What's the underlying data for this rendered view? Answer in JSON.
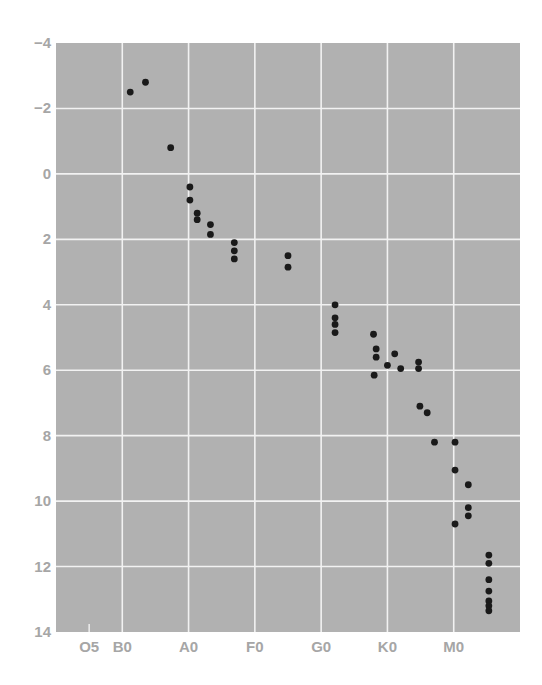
{
  "chart_data": {
    "type": "scatter",
    "title": "",
    "xlabel": "",
    "ylabel": "",
    "x_axis": {
      "kind": "spectral_class",
      "range": [
        0,
        70
      ],
      "tick_values": [
        5,
        10,
        20,
        30,
        40,
        50,
        60
      ],
      "tick_labels": [
        "O5",
        "B0",
        "A0",
        "F0",
        "G0",
        "K0",
        "M0"
      ],
      "gridlines": [
        10,
        20,
        30,
        40,
        50,
        60
      ]
    },
    "y_axis": {
      "range": [
        -4,
        14
      ],
      "inverted": true,
      "tick_values": [
        -4,
        -2,
        0,
        2,
        4,
        6,
        8,
        10,
        12,
        14
      ],
      "tick_labels": [
        "−4",
        "−2",
        "0",
        "2",
        "4",
        "6",
        "8",
        "10",
        "12",
        "14"
      ],
      "gridlines": [
        -2,
        0,
        2,
        4,
        6,
        8,
        10,
        12
      ]
    },
    "grid": true,
    "legend": null,
    "colors": {
      "background": "#b1b1b1",
      "grid": "#f2f2f2",
      "point": "#1a1a1a",
      "tick_text": "#a6a6a6"
    },
    "points": [
      {
        "x": 11.2,
        "y": -2.5
      },
      {
        "x": 13.5,
        "y": -2.8
      },
      {
        "x": 17.3,
        "y": -0.8
      },
      {
        "x": 20.2,
        "y": 0.4
      },
      {
        "x": 20.2,
        "y": 0.8
      },
      {
        "x": 21.3,
        "y": 1.2
      },
      {
        "x": 21.3,
        "y": 1.4
      },
      {
        "x": 23.3,
        "y": 1.55
      },
      {
        "x": 23.3,
        "y": 1.85
      },
      {
        "x": 26.9,
        "y": 2.1
      },
      {
        "x": 26.9,
        "y": 2.35
      },
      {
        "x": 26.9,
        "y": 2.6
      },
      {
        "x": 35.0,
        "y": 2.5
      },
      {
        "x": 35.0,
        "y": 2.85
      },
      {
        "x": 42.1,
        "y": 4.0
      },
      {
        "x": 42.1,
        "y": 4.4
      },
      {
        "x": 42.1,
        "y": 4.6
      },
      {
        "x": 42.1,
        "y": 4.85
      },
      {
        "x": 47.9,
        "y": 4.9
      },
      {
        "x": 48.3,
        "y": 5.35
      },
      {
        "x": 48.3,
        "y": 5.6
      },
      {
        "x": 48.0,
        "y": 6.15
      },
      {
        "x": 50.0,
        "y": 5.85
      },
      {
        "x": 51.1,
        "y": 5.5
      },
      {
        "x": 52.0,
        "y": 5.95
      },
      {
        "x": 54.7,
        "y": 5.75
      },
      {
        "x": 54.7,
        "y": 5.95
      },
      {
        "x": 54.9,
        "y": 7.1
      },
      {
        "x": 56.0,
        "y": 7.3
      },
      {
        "x": 57.1,
        "y": 8.2
      },
      {
        "x": 60.2,
        "y": 8.2
      },
      {
        "x": 60.2,
        "y": 9.05
      },
      {
        "x": 62.2,
        "y": 9.5
      },
      {
        "x": 62.2,
        "y": 10.2
      },
      {
        "x": 62.2,
        "y": 10.45
      },
      {
        "x": 60.2,
        "y": 10.7
      },
      {
        "x": 65.3,
        "y": 11.65
      },
      {
        "x": 65.3,
        "y": 11.9
      },
      {
        "x": 65.3,
        "y": 12.4
      },
      {
        "x": 65.3,
        "y": 12.75
      },
      {
        "x": 65.3,
        "y": 13.05
      },
      {
        "x": 65.3,
        "y": 13.2
      },
      {
        "x": 65.3,
        "y": 13.35
      }
    ]
  }
}
